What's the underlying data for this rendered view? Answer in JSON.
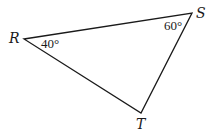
{
  "diagram": {
    "type": "triangle",
    "stroke_color": "#1a1a1a",
    "vertices": [
      {
        "name": "R",
        "label": "R",
        "x": 24,
        "y": 39,
        "label_x": 9,
        "label_y": 43
      },
      {
        "name": "S",
        "label": "S",
        "x": 192,
        "y": 13,
        "label_x": 196,
        "label_y": 18
      },
      {
        "name": "T",
        "label": "T",
        "x": 141,
        "y": 113,
        "label_x": 136,
        "label_y": 129
      }
    ],
    "angles": [
      {
        "vertex": "R",
        "label": "40°",
        "x": 41,
        "y": 48
      },
      {
        "vertex": "S",
        "label": "60°",
        "x": 164,
        "y": 30
      }
    ]
  }
}
